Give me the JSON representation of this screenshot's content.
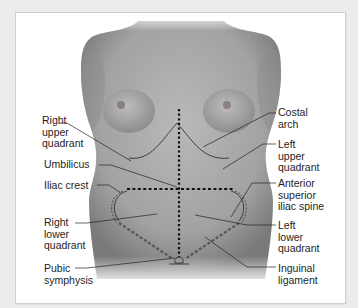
{
  "diagram": {
    "colors": {
      "background": "#ececec",
      "frame": "#ffffff",
      "skin_light": "#b8b8b8",
      "skin_dark": "#6e6e6e",
      "line": "#1e1e1e",
      "dotted_line": "#111111"
    },
    "labels_left": [
      {
        "id": "right-upper-quadrant",
        "text": "Right\nupper\nquadrant"
      },
      {
        "id": "umbilicus",
        "text": "Umbilicus"
      },
      {
        "id": "iliac-crest",
        "text": "Iliac crest"
      },
      {
        "id": "right-lower-quadrant",
        "text": "Right\nlower\nquadrant"
      },
      {
        "id": "pubic-symphysis",
        "text": "Pubic\nsymphysis"
      }
    ],
    "labels_right": [
      {
        "id": "costal-arch",
        "text": "Costal\narch"
      },
      {
        "id": "left-upper-quadrant",
        "text": "Left\nupper\nquadrant"
      },
      {
        "id": "anterior-superior-iliac-spine",
        "text": "Anterior\nsuperior\niliac spine"
      },
      {
        "id": "left-lower-quadrant",
        "text": "Left\nlower\nquadrant"
      },
      {
        "id": "inguinal-ligament",
        "text": "Inguinal\nligament"
      }
    ]
  }
}
